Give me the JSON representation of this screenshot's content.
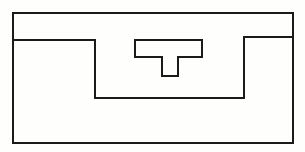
{
  "diagram": {
    "background": "#fefefc",
    "stroke_color": "#1a1a1a",
    "stroke_width": 2,
    "outer_frame": {
      "x": 13,
      "y": 13,
      "width": 280,
      "height": 130
    },
    "channel_profile": {
      "points": "13,40 95,40 95,98 244,98 244,37 293,37"
    },
    "t_shape": {
      "points": "135,40 202,40 202,57 178,57 178,76 162,76 162,57 135,57 135,40"
    }
  }
}
